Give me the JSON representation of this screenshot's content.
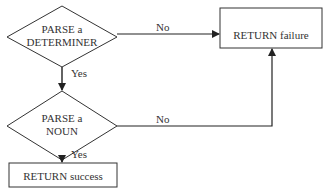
{
  "diagram": {
    "type": "flowchart",
    "nodes": [
      {
        "id": "parse_det",
        "shape": "diamond",
        "line1": "PARSE a",
        "line2": "DETERMINER"
      },
      {
        "id": "parse_noun",
        "shape": "diamond",
        "line1": "PARSE a",
        "line2": "NOUN"
      },
      {
        "id": "ret_fail",
        "shape": "rectangle",
        "label": "RETURN failure"
      },
      {
        "id": "ret_succ",
        "shape": "rectangle",
        "label": "RETURN success"
      }
    ],
    "edges": [
      {
        "from": "parse_det",
        "to": "parse_noun",
        "label": "Yes"
      },
      {
        "from": "parse_det",
        "to": "ret_fail",
        "label": "No"
      },
      {
        "from": "parse_noun",
        "to": "ret_succ",
        "label": "Yes"
      },
      {
        "from": "parse_noun",
        "to": "ret_fail",
        "label": "No"
      }
    ]
  }
}
